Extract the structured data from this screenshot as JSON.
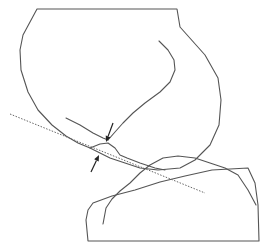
{
  "diagram": {
    "width": 267,
    "height": 249,
    "colors": {
      "line": "#555555",
      "tangent": "#666666",
      "arrow": "#222222",
      "background": "#ffffff"
    },
    "upper_body": {
      "outline": "M37,9 L177,9 L180,27 L205,55 L218,78 L221,100 L219,125 L210,145 L195,160 L180,168 L158,170 L140,168 L125,163 L110,158 L98,152 L90,148 L78,143 L66,136 L52,125 L38,110 L28,92 L21,70 L20,50 L23,35 Z",
      "inner_curve": "M159,41 L168,50 L174,60 L175,70 L170,82 L160,92 L145,103 L133,113 L123,123 L115,132 L108,140",
      "lower_curve": "M66,118 L80,125 L93,133 L103,138 L108,140"
    },
    "lower_body": {
      "outline": "M88,241 L86,220 L88,210 L93,203 L112,196 L135,190 L160,182 L185,176 L212,170 L248,168 L255,183 L258,205 L259,241 Z",
      "inner_curve": "M103,224 L106,208 L112,199 L120,191 L130,183 L140,173 L150,165 L163,158 L178,156 L195,158 L210,163 L225,168 L238,175 L248,190 L256,205"
    },
    "contact_curve": "M90,148 L100,144 L108,143 L115,148 L120,155 L127,158 L140,163 L155,168 L165,170",
    "tangent_line": {
      "x1": 10,
      "y1": 114,
      "x2": 205,
      "y2": 193
    },
    "arrows": [
      {
        "name": "upper-arrow",
        "x1": 113,
        "y1": 123,
        "x2": 106,
        "y2": 142
      },
      {
        "name": "lower-arrow",
        "x1": 91,
        "y1": 172,
        "x2": 99,
        "y2": 155
      }
    ]
  }
}
